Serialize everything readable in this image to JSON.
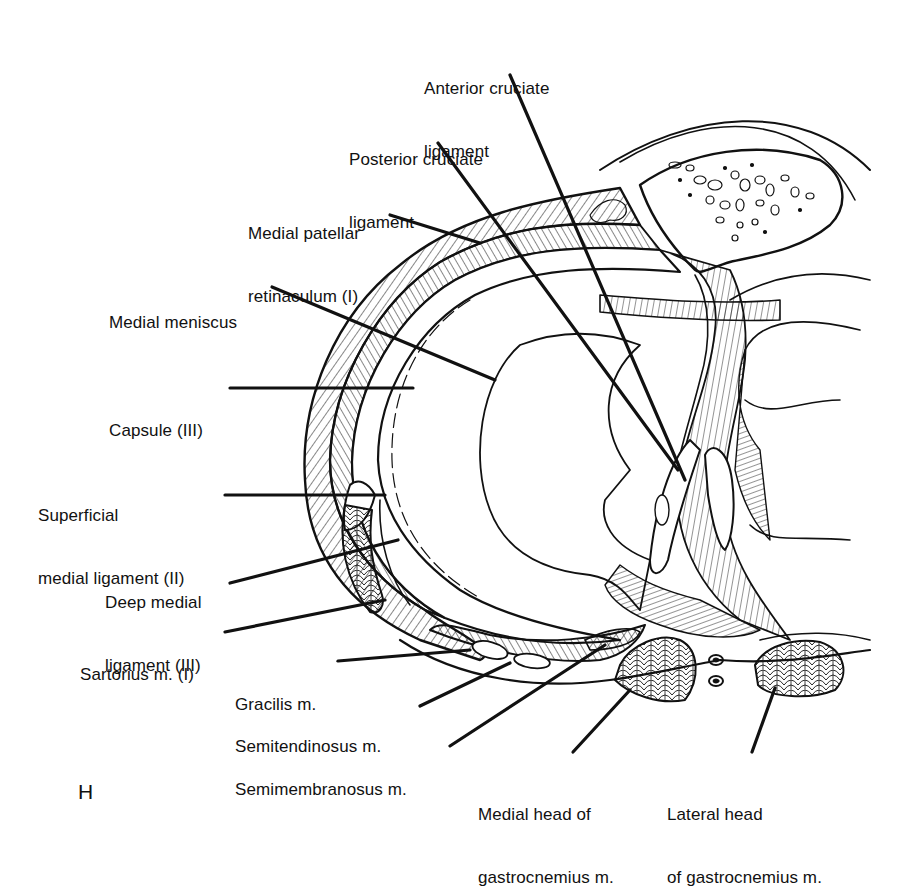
{
  "figure": {
    "panel_letter": "H",
    "line_color": "#111111",
    "background": "#ffffff"
  },
  "labels": {
    "acl": {
      "line1": "Anterior cruciate",
      "line2": "ligament"
    },
    "pcl": {
      "line1": "Posterior cruciate",
      "line2": "ligament"
    },
    "medial_patellar_retinaculum": {
      "line1": "Medial patellar",
      "line2": "retinaculum (I)"
    },
    "medial_meniscus": {
      "line1": "Medial meniscus"
    },
    "capsule": {
      "line1": "Capsule (III)"
    },
    "superficial_medial_ligament": {
      "line1": "Superficial",
      "line2": "medial ligament (II)"
    },
    "deep_medial_ligament": {
      "line1": "Deep medial",
      "line2": "ligament (III)"
    },
    "sartorius": {
      "line1": "Sartorius m. (I)"
    },
    "gracilis": {
      "line1": "Gracilis m."
    },
    "semitendinosus": {
      "line1": "Semitendinosus m."
    },
    "semimembranosus": {
      "line1": "Semimembranosus m."
    },
    "medial_gastrocnemius": {
      "line1": "Medial head of",
      "line2": "gastrocnemius m."
    },
    "lateral_gastrocnemius": {
      "line1": "Lateral head",
      "line2": "of gastrocnemius m."
    }
  }
}
